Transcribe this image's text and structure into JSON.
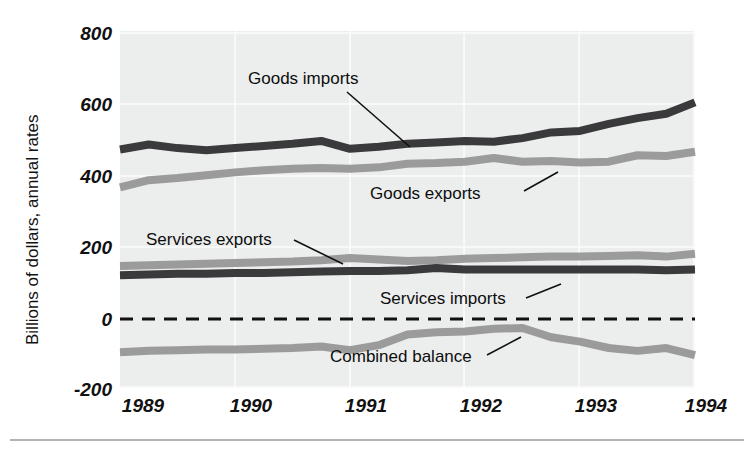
{
  "figure": {
    "ylabel": "Billions of dollars, annual rates",
    "background": "#ffffff",
    "plot_background": "#eceded",
    "series_colors": {
      "dark": "#3a3a3c",
      "gray": "#9b9b9b"
    }
  },
  "chart_data": {
    "type": "line",
    "title": "",
    "subtitle": "",
    "xlabel": "",
    "ylabel": "Billions of dollars, annual rates",
    "xlim": [
      1989,
      1994
    ],
    "ylim": [
      -200,
      800
    ],
    "yticks": [
      800,
      600,
      400,
      200,
      0,
      -200
    ],
    "ytick_labels": [
      "800",
      "600",
      "400",
      "200",
      "0",
      "-200"
    ],
    "xticks": [
      1989,
      1990,
      1991,
      1992,
      1993,
      1994
    ],
    "xtick_labels": [
      "1989",
      "1990",
      "1991",
      "1992",
      "1993",
      "1994"
    ],
    "grid": true,
    "legend": "inline-annotations",
    "zero_reference_line": 0,
    "x": [
      1989.0,
      1989.25,
      1989.5,
      1989.75,
      1990.0,
      1990.25,
      1990.5,
      1990.75,
      1991.0,
      1991.25,
      1991.5,
      1991.75,
      1992.0,
      1992.25,
      1992.5,
      1992.75,
      1993.0,
      1993.25,
      1993.5,
      1993.75,
      1994.0
    ],
    "series": [
      {
        "name": "Goods imports",
        "color": "#3a3a3c",
        "values": [
          468,
          482,
          472,
          466,
          472,
          478,
          484,
          492,
          470,
          476,
          484,
          488,
          492,
          490,
          500,
          516,
          520,
          540,
          556,
          568,
          600
        ]
      },
      {
        "name": "Goods exports",
        "color": "#9b9b9b",
        "values": [
          362,
          382,
          388,
          396,
          404,
          410,
          414,
          416,
          414,
          418,
          428,
          430,
          434,
          444,
          434,
          436,
          432,
          434,
          452,
          450,
          462
        ]
      },
      {
        "name": "Services exports",
        "color": "#9b9b9b",
        "values": [
          142,
          144,
          146,
          148,
          150,
          152,
          154,
          158,
          164,
          160,
          156,
          158,
          162,
          164,
          166,
          168,
          168,
          170,
          172,
          168,
          176
        ]
      },
      {
        "name": "Services imports",
        "color": "#3a3a3c",
        "values": [
          116,
          118,
          120,
          120,
          122,
          122,
          124,
          126,
          128,
          128,
          130,
          136,
          132,
          132,
          132,
          132,
          132,
          132,
          132,
          130,
          132
        ]
      },
      {
        "name": "Combined balance",
        "color": "#9b9b9b",
        "values": [
          -100,
          -96,
          -94,
          -92,
          -92,
          -90,
          -88,
          -84,
          -94,
          -80,
          -50,
          -44,
          -42,
          -34,
          -32,
          -58,
          -70,
          -88,
          -96,
          -88,
          -108
        ]
      }
    ],
    "annotations": [
      {
        "text": "Goods imports",
        "series": "Goods imports"
      },
      {
        "text": "Goods exports",
        "series": "Goods exports"
      },
      {
        "text": "Services exports",
        "series": "Services exports"
      },
      {
        "text": "Services imports",
        "series": "Services imports"
      },
      {
        "text": "Combined balance",
        "series": "Combined balance"
      }
    ]
  }
}
